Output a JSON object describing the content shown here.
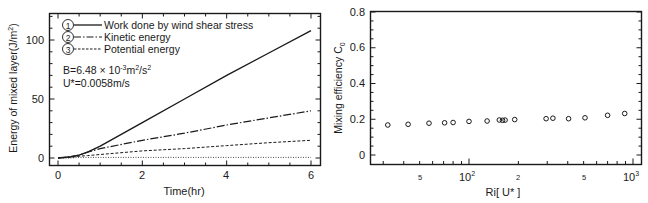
{
  "chart_data": [
    {
      "type": "line",
      "xlabel": "Time(hr)",
      "ylabel": "Energy of mixed layer(J/m²)",
      "xlim": [
        -0.2,
        6.2
      ],
      "ylim": [
        -5,
        125
      ],
      "xticks": [
        0,
        2,
        4,
        6
      ],
      "yticks": [
        0,
        50,
        100
      ],
      "grid": false,
      "legend_position": "upper-left",
      "legend": [
        {
          "marker": "①",
          "label": "Work done by wind shear stress",
          "style": "solid"
        },
        {
          "marker": "②",
          "label": "Kinetic energy",
          "style": "dash-dot"
        },
        {
          "marker": "③",
          "label": "Potential energy",
          "style": "dashed"
        }
      ],
      "annotations": [
        "B=6.48 × 10⁻³m²/s²",
        "U*=0.0058m/s"
      ],
      "x": [
        0,
        0.3,
        0.5,
        0.7,
        1,
        2,
        3,
        4,
        5,
        6
      ],
      "series": [
        {
          "name": "Work done by wind shear stress",
          "values": [
            0,
            1,
            2.5,
            5,
            10,
            30,
            50,
            70,
            89,
            108
          ]
        },
        {
          "name": "Kinetic energy",
          "values": [
            0,
            1,
            2.5,
            5,
            8,
            15,
            21,
            28,
            34,
            40
          ]
        },
        {
          "name": "Potential energy",
          "values": [
            0,
            0.5,
            1.5,
            2,
            3,
            6,
            8,
            10.5,
            13,
            15
          ]
        },
        {
          "name": "Reference (dotted)",
          "values": [
            0,
            0,
            0.5,
            0.5,
            0.5,
            0.5,
            0.5,
            0.5,
            0.5,
            0.5
          ]
        }
      ]
    },
    {
      "type": "scatter",
      "xlabel": "Ri[ U* ]",
      "ylabel": "Mixing efficiency C₀",
      "xscale": "log",
      "xlim": [
        25,
        1100
      ],
      "ylim": [
        -0.05,
        0.8
      ],
      "yticks": [
        0,
        0.2,
        0.4,
        0.6,
        0.8
      ],
      "xtick_labels": [
        "5",
        "10²",
        "2",
        "5",
        "10³"
      ],
      "xtick_values": [
        50,
        100,
        200,
        500,
        1000
      ],
      "grid": false,
      "marker": "open-circle",
      "x": [
        32,
        42.5,
        57,
        71,
        80,
        100,
        129,
        153,
        160,
        166,
        190,
        295,
        325,
        405,
        510,
        700,
        890
      ],
      "values": [
        0.168,
        0.172,
        0.178,
        0.18,
        0.182,
        0.188,
        0.19,
        0.196,
        0.194,
        0.195,
        0.198,
        0.203,
        0.206,
        0.203,
        0.208,
        0.222,
        0.232
      ]
    }
  ],
  "left": {
    "ylabel": "Energy of mixed layer(J/m",
    "ylabel_sup": "2",
    "ylabel_end": ")",
    "xlabel": "Time(hr)",
    "xticks": [
      "0",
      "2",
      "4",
      "6"
    ],
    "yticks": [
      "0",
      "50",
      "100"
    ],
    "legend": [
      {
        "num": "1",
        "label": "Work done by wind shear stress"
      },
      {
        "num": "2",
        "label": "Kinetic energy"
      },
      {
        "num": "3",
        "label": "Potential energy"
      }
    ],
    "ann_b_pre": "B=6.48 × 10",
    "ann_b_exp": "-3",
    "ann_b_mid": "m",
    "ann_b_exp2": "2",
    "ann_b_mid2": "/s",
    "ann_b_exp3": "2",
    "ann_u": "U*=0.0058m/s"
  },
  "right": {
    "ylabel": "Mixing efficiency C",
    "ylabel_sub": "0",
    "xlabel": "Ri[ U* ]",
    "yticks": [
      "0",
      "0.2",
      "0.4",
      "0.6",
      "0.8"
    ],
    "xticks_minor_labels": [
      "5",
      "2",
      "5"
    ],
    "xtick_100": "10",
    "xtick_1000": "10",
    "xtick_sup_100": "2",
    "xtick_sup_1000": "3"
  }
}
